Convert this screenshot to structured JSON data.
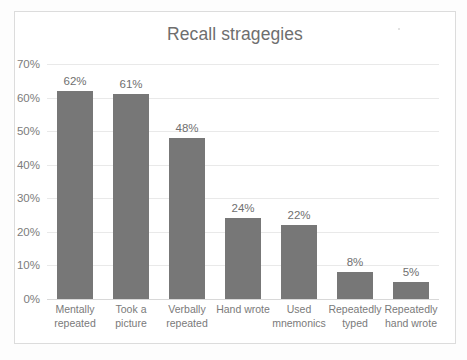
{
  "chart_data": {
    "type": "bar",
    "title": "Recall stragegies",
    "xlabel": "",
    "ylabel": "",
    "ylim": [
      0,
      70
    ],
    "ytick_labels": [
      "0%",
      "10%",
      "20%",
      "30%",
      "40%",
      "50%",
      "60%",
      "70%"
    ],
    "ytick_values": [
      0,
      10,
      20,
      30,
      40,
      50,
      60,
      70
    ],
    "grid": true,
    "legend": false,
    "categories": [
      "Mentally repeated",
      "Took a picture",
      "Verbally repeated",
      "Hand wrote",
      "Used mnemonics",
      "Repeatedly typed",
      "Repeatedly hand wrote"
    ],
    "category_lines": [
      [
        "Mentally",
        "repeated"
      ],
      [
        "Took a",
        "picture"
      ],
      [
        "Verbally",
        "repeated"
      ],
      [
        "Hand wrote",
        ""
      ],
      [
        "Used",
        "mnemonics"
      ],
      [
        "Repeatedly",
        "typed"
      ],
      [
        "Repeatedly",
        "hand wrote"
      ]
    ],
    "values": [
      62,
      61,
      48,
      24,
      22,
      8,
      5
    ],
    "data_labels": [
      "62%",
      "61%",
      "48%",
      "24%",
      "22%",
      "8%",
      "5%"
    ],
    "series_name": "",
    "colors": {
      "bar": "#777777",
      "gridline": "#e9e9e9",
      "axis_text": "#7c7c7c",
      "title_text": "#6e6e6e",
      "category_text": "#7a7a7a",
      "plot_background": "#ffffff",
      "frame_border": "#dcdcdc"
    }
  }
}
